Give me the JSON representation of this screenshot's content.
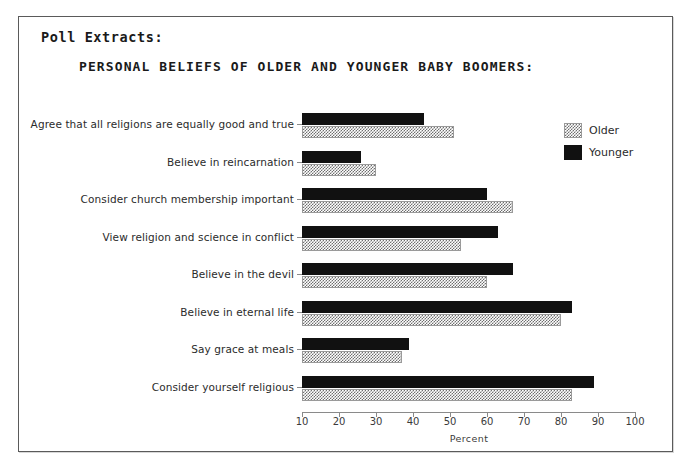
{
  "header": {
    "poll_extracts_label": "Poll Extracts:",
    "title": "PERSONAL BELIEFS OF OLDER AND YOUNGER BABY BOOMERS:"
  },
  "legend": {
    "position": "top-right",
    "entries": [
      {
        "label": "Older",
        "swatch": "hatched-gray"
      },
      {
        "label": "Younger",
        "swatch": "solid-black"
      }
    ]
  },
  "chart_data": {
    "type": "bar",
    "orientation": "horizontal",
    "title": "PERSONAL BELIEFS OF OLDER AND YOUNGER BABY BOOMERS:",
    "xlabel": "Percent",
    "ylabel": "",
    "xlim": [
      10,
      100
    ],
    "xticks": [
      10,
      20,
      30,
      40,
      50,
      60,
      70,
      80,
      90,
      100
    ],
    "grid": false,
    "legend_position": "top-right",
    "categories": [
      "Agree that all religions are equally good and true",
      "Believe in reincarnation",
      "Consider church membership important",
      "View religion and science in conflict",
      "Believe in the devil",
      "Believe in eternal life",
      "Say grace at meals",
      "Consider yourself religious"
    ],
    "series": [
      {
        "name": "Younger",
        "values": [
          43,
          26,
          60,
          63,
          67,
          83,
          39,
          89
        ]
      },
      {
        "name": "Older",
        "values": [
          51,
          30,
          67,
          53,
          60,
          80,
          37,
          83
        ]
      }
    ]
  }
}
